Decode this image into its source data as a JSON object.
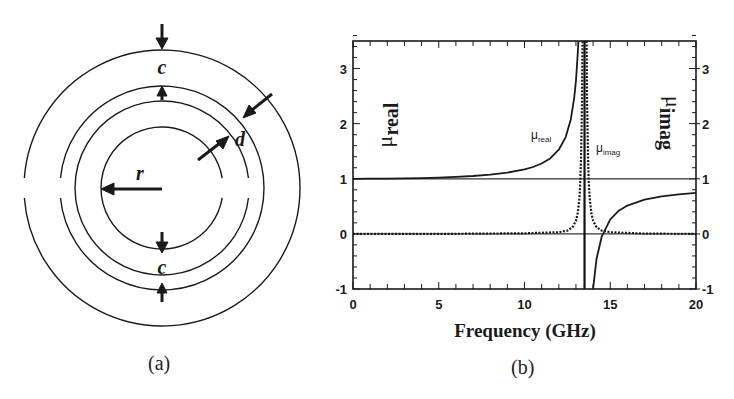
{
  "figure_a": {
    "caption": "(a)",
    "labels": {
      "c_top": "c",
      "c_bottom": "c",
      "d": "d",
      "r": "r"
    },
    "geometry": {
      "center": [
        162,
        188
      ],
      "rings": [
        {
          "name": "outer-ring-outer-circle",
          "radius": 138,
          "gap_side": "left"
        },
        {
          "name": "outer-ring-inner-circle",
          "radius": 102,
          "gap_side": "left"
        },
        {
          "name": "inner-ring-outer-circle",
          "radius": 87,
          "gap_side": "right"
        },
        {
          "name": "inner-ring-inner-circle",
          "radius": 61,
          "gap_side": "right"
        }
      ]
    },
    "ink_color": "#1a1a1a"
  },
  "figure_b": {
    "caption": "(b)",
    "xlabel": "Frequency (GHz)",
    "ylabel_left": "μ",
    "ylabel_left_sub": "real",
    "ylabel_right": "μ",
    "ylabel_right_sub": "imag",
    "curve_label_real": "μ",
    "curve_label_real_sub": "real",
    "curve_label_imag": "μ",
    "curve_label_imag_sub": "imag",
    "x_ticks": [
      "0",
      "5",
      "10",
      "15",
      "20"
    ],
    "y_ticks_left": [
      "-1",
      "0",
      "1",
      "2",
      "3"
    ],
    "y_ticks_right": [
      "-1",
      "0",
      "1",
      "2",
      "3"
    ]
  },
  "chart_data": {
    "type": "line",
    "title": "",
    "xlabel": "Frequency (GHz)",
    "ylabel": "μ_real",
    "ylabel_right": "μ_imag",
    "xlim": [
      0,
      20
    ],
    "ylim": [
      -1,
      3.5
    ],
    "x_ticks": [
      0,
      5,
      10,
      15,
      20
    ],
    "y_ticks": [
      -1,
      0,
      1,
      2,
      3
    ],
    "grid": false,
    "legend": "inline labels",
    "reference_lines": [
      {
        "axis": "y",
        "value": 1,
        "style": "solid-thin"
      },
      {
        "axis": "y",
        "value": 0,
        "style": "solid-thin"
      },
      {
        "axis": "x",
        "value": 13.5,
        "style": "solid",
        "note": "resonance"
      }
    ],
    "series": [
      {
        "name": "μ_real",
        "style": "solid",
        "segments": [
          {
            "x": [
              0,
              1,
              2,
              3,
              4,
              5,
              6,
              7,
              8,
              9,
              10,
              10.5,
              11,
              11.5,
              12,
              12.4,
              12.7,
              12.9,
              13.0,
              13.1,
              13.14
            ],
            "y": [
              1.0,
              1.001,
              1.003,
              1.007,
              1.013,
              1.022,
              1.034,
              1.051,
              1.076,
              1.112,
              1.17,
              1.214,
              1.277,
              1.37,
              1.527,
              1.756,
              2.077,
              2.47,
              2.786,
              3.258,
              3.5
            ]
          },
          {
            "x": [
              13.99,
              14.0,
              14.2,
              14.5,
              15,
              15.5,
              16,
              17,
              18,
              19,
              20
            ],
            "y": [
              -1.0,
              -0.996,
              -0.456,
              -0.051,
              0.263,
              0.42,
              0.514,
              0.621,
              0.68,
              0.717,
              0.743
            ]
          }
        ]
      },
      {
        "name": "μ_imag",
        "style": "dashed",
        "segments": [
          {
            "x": [
              0,
              5,
              10,
              12,
              12.5,
              12.8,
              13.0,
              13.1,
              13.2,
              13.25,
              13.3,
              13.35,
              13.38
            ],
            "y": [
              0,
              0,
              0.01,
              0.03,
              0.06,
              0.12,
              0.24,
              0.37,
              0.65,
              0.92,
              1.41,
              2.37,
              3.5
            ]
          },
          {
            "x": [
              13.62,
              13.65,
              13.7,
              13.75,
              13.8,
              13.9,
              14.0,
              14.2,
              14.5,
              15,
              17,
              20
            ],
            "y": [
              3.5,
              2.37,
              1.41,
              0.92,
              0.65,
              0.37,
              0.24,
              0.12,
              0.06,
              0.03,
              0.005,
              0
            ]
          }
        ]
      }
    ]
  }
}
